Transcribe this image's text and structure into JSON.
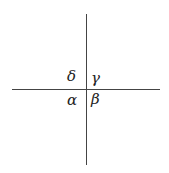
{
  "diagram": {
    "type": "intersecting-lines-angles",
    "lines": [
      {
        "name": "vertical",
        "orientation": "vertical"
      },
      {
        "name": "horizontal",
        "orientation": "horizontal"
      }
    ],
    "angles": {
      "top_left": "δ",
      "top_right": "γ",
      "bottom_left": "α",
      "bottom_right": "β"
    }
  }
}
